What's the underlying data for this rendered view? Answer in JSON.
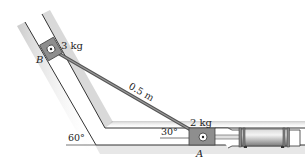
{
  "diagram": {
    "type": "mechanism",
    "labels": {
      "mass_b": "3 kg",
      "point_b": "B",
      "link_length": "0.5 m",
      "mass_a": "2 kg",
      "point_a": "A",
      "angle_incline": "60°",
      "angle_link": "30°"
    },
    "colors": {
      "guide_line": "#333333",
      "guide_shadow": "#bdbdbd",
      "block_fill": "#8c8c8c",
      "rod": "#555555",
      "cylinder": "#9a9a9a"
    }
  }
}
